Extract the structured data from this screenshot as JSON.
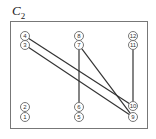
{
  "title": {
    "main": "C",
    "subscript": "2"
  },
  "frame": {
    "x": 10,
    "y": 21,
    "width": 137,
    "height": 107
  },
  "nodes": [
    {
      "id": "1",
      "x": 25,
      "y": 117
    },
    {
      "id": "2",
      "x": 25,
      "y": 107
    },
    {
      "id": "3",
      "x": 25,
      "y": 45
    },
    {
      "id": "4",
      "x": 25,
      "y": 36
    },
    {
      "id": "5",
      "x": 79,
      "y": 117
    },
    {
      "id": "6",
      "x": 79,
      "y": 107
    },
    {
      "id": "7",
      "x": 79,
      "y": 45
    },
    {
      "id": "8",
      "x": 79,
      "y": 36
    },
    {
      "id": "9",
      "x": 133,
      "y": 117
    },
    {
      "id": "10",
      "x": 133,
      "y": 106
    },
    {
      "id": "11",
      "x": 133,
      "y": 45
    },
    {
      "id": "12",
      "x": 133,
      "y": 36
    }
  ],
  "edges": [
    {
      "from": "4",
      "to": "10"
    },
    {
      "from": "3",
      "to": "9"
    },
    {
      "from": "7",
      "to": "6"
    },
    {
      "from": "7",
      "to": "9"
    },
    {
      "from": "11",
      "to": "10"
    }
  ],
  "node_radius": 4.5
}
